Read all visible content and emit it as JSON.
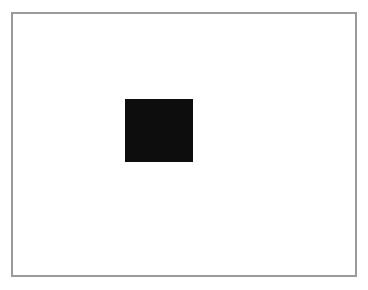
{
  "figure": {
    "type": "shape-graphic",
    "caption": "",
    "background_color": "#ffffff",
    "width": 368,
    "height": 290
  },
  "frame": {
    "border_color": "#9a9a9a",
    "border_width_px": 2,
    "fill_color": "#ffffff",
    "x": 11,
    "y": 12,
    "width": 346,
    "height": 265,
    "label": ""
  },
  "shapes": [
    {
      "name": "black-rectangle",
      "kind": "rectangle",
      "fill_color": "#0d0d0d",
      "stroke_color": "none",
      "x": 125,
      "y": 99,
      "width": 68,
      "height": 63,
      "label": ""
    }
  ],
  "chart_data": {
    "type": "table",
    "title": "",
    "xlabel": "",
    "ylabel": "",
    "categories": [
      "black-rectangle"
    ],
    "values": [
      1
    ],
    "annotations": []
  }
}
